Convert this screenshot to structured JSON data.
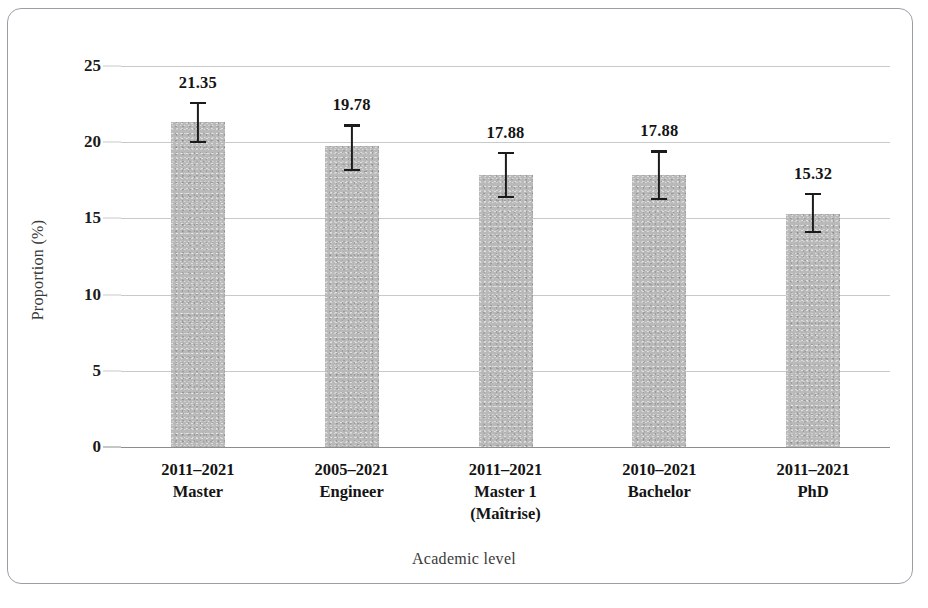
{
  "chart_data": {
    "type": "bar",
    "title": "",
    "xlabel": "Academic level",
    "ylabel": "Proportion (%)",
    "categories": [
      "2011–2021\nMaster",
      "2005–2021\nEngineer",
      "2011–2021\nMaster 1\n(Maîtrise)",
      "2010–2021\nBachelor",
      "2011–2021\nPhD"
    ],
    "category_lines": [
      [
        "2011–2021",
        "Master"
      ],
      [
        "2005–2021",
        "Engineer"
      ],
      [
        "2011–2021",
        "Master 1",
        "(Maîtrise)"
      ],
      [
        "2010–2021",
        "Bachelor"
      ],
      [
        "2011–2021",
        "PhD"
      ]
    ],
    "values": [
      21.35,
      19.78,
      17.88,
      17.88,
      15.32
    ],
    "value_labels": [
      "21.35",
      "19.78",
      "17.88",
      "17.88",
      "15.32"
    ],
    "errors_low": [
      20.0,
      18.2,
      16.4,
      16.3,
      14.1
    ],
    "errors_high": [
      22.6,
      21.1,
      19.3,
      19.4,
      16.6
    ],
    "ylim": [
      0,
      25
    ],
    "yticks": [
      0,
      5,
      10,
      15,
      20,
      25
    ],
    "ytick_labels": [
      "0",
      "5",
      "10",
      "15",
      "20",
      "25"
    ],
    "grid": true,
    "legend": false,
    "bar_color": "#b9b9b9",
    "error_color": "#1b1b1b",
    "grid_color": "#c9c9c9",
    "axis_color": "#8d8d8d",
    "text_color": "#141414"
  }
}
